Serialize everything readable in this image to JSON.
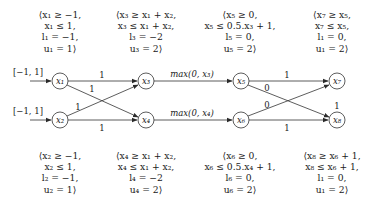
{
  "constraints": {
    "x1": [
      "⟨x₁ ≥ −1,",
      "x₁ ≤ 1,",
      "l₁ = −1,",
      "u₁ = 1⟩"
    ],
    "x2": [
      "⟨x₂ ≥ −1,",
      "x₂ ≤ 1,",
      "l₂ = −1,",
      "u₂ = 1⟩"
    ],
    "x3": [
      "⟨x₃ ≥ x₁ + x₂,",
      "x₃ ≤ x₁ + x₂,",
      "l₃ = −2",
      "u₃ = 2⟩"
    ],
    "x4": [
      "⟨x₄ ≥ x₁ + x₂,",
      "x₄ ≤ x₁ + x₂,",
      "l₄ = −2",
      "u₄ = 2⟩"
    ],
    "x5": [
      "⟨x₅ ≥ 0,",
      "x₅ ≤ 0.5.x₃ + 1,",
      "l₅ = 0,",
      "u₅ = 2⟩"
    ],
    "x6": [
      "⟨x₆ ≥ 0,",
      "x₆ ≤ 0.5.x₄ + 1,",
      "l₆ = 0,",
      "u₆ = 2⟩"
    ],
    "x7": [
      "⟨x₇ ≥ x₅,",
      "x₇ ≤ x₅,",
      "l₁ = 0,",
      "u₁ = 2⟩"
    ],
    "x8": [
      "⟨x₈ ≥ x₆ + 1,",
      "x₈ ≤ x₆ + 1,",
      "l₁ = 0,",
      "u₁ = 2⟩"
    ]
  },
  "nodes": {
    "x1": "x₁",
    "x2": "x₂",
    "x3": "x₃",
    "x4": "x₄",
    "x5": "x₅",
    "x6": "x₆",
    "x7": "x₇",
    "x8": "x₈"
  },
  "inputs": {
    "x1": "[−1, 1]",
    "x2": "[−1, 1]"
  },
  "edge_labels": {
    "x1_x3": "1",
    "x1_x4": "1",
    "x2_x3": "1",
    "x2_x4": "1",
    "x3_x5": "max(0, x₃)",
    "x4_x6": "max(0, x₄)",
    "x5_x7": "1",
    "x5_x8": "0",
    "x6_x7": "0",
    "x6_x8": "1",
    "x8_bias": "1"
  }
}
